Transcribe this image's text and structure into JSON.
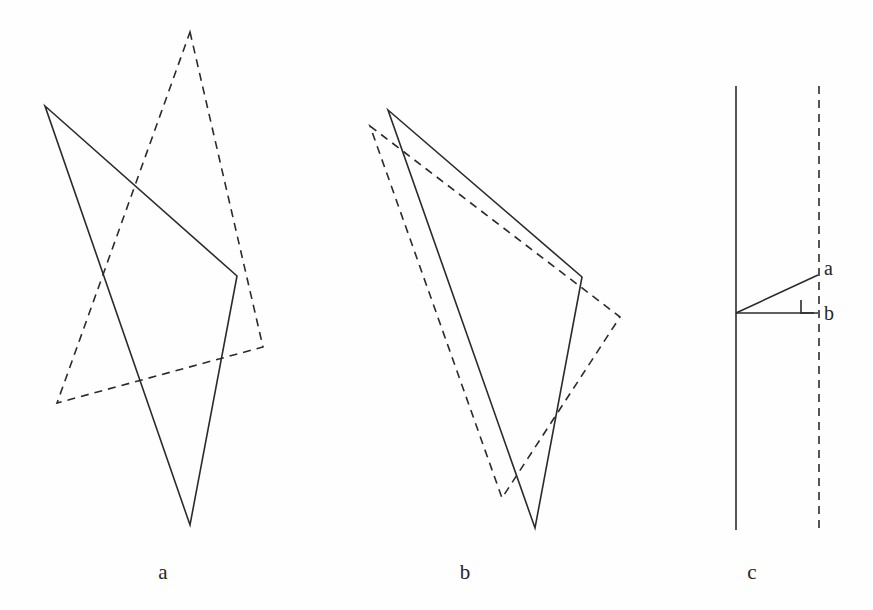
{
  "figure": {
    "kind": "geometry-diagram",
    "background_color": "#fefefe",
    "stroke_color": "#2b2b2b",
    "width": 873,
    "height": 610,
    "panels": [
      {
        "id": "a",
        "caption": "a",
        "caption_x": 163,
        "caption_y": 562,
        "shapes": [
          {
            "name": "solid-triangle-a",
            "style": "solid",
            "points": "45,106 237,276 190,525"
          },
          {
            "name": "dashed-triangle-a",
            "style": "dashed",
            "points": "190,32 263,347 57,403"
          }
        ]
      },
      {
        "id": "b",
        "caption": "b",
        "caption_x": 465,
        "caption_y": 562,
        "shapes": [
          {
            "name": "solid-triangle-b",
            "style": "solid",
            "points": "388,110 582,277 535,528"
          },
          {
            "name": "dashed-triangle-b",
            "style": "dashed",
            "points": "370,126 620,317 502,498"
          }
        ]
      },
      {
        "id": "c",
        "caption": "c",
        "caption_x": 752,
        "caption_y": 562,
        "shapes": [
          {
            "name": "solid-vertical-line-c",
            "style": "solid",
            "points": "736,86 736,530"
          },
          {
            "name": "dashed-vertical-line-c",
            "style": "dashed",
            "points": "819,86 819,530"
          },
          {
            "name": "hypotenuse-segment-a",
            "style": "solid",
            "points": "736,313 818,275"
          },
          {
            "name": "base-segment-b",
            "style": "solid",
            "points": "736,313 818,313"
          }
        ],
        "right_angle_marker": {
          "name": "right-angle-marker",
          "x": 801,
          "y": 300,
          "size": 13
        },
        "labels": [
          {
            "name": "label-a",
            "text": "a",
            "x": 824,
            "y": 258
          },
          {
            "name": "label-b",
            "text": "b",
            "x": 824,
            "y": 303
          }
        ]
      }
    ]
  },
  "style": {
    "stroke_width": 1.6,
    "dash_pattern": "8,6"
  }
}
